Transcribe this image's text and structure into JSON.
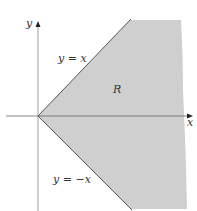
{
  "diagram": {
    "axes": {
      "x_label": "x",
      "y_label": "y"
    },
    "region": {
      "label": "R",
      "fill": "#cfcfcf"
    },
    "lines": [
      {
        "label": "y = x",
        "slope": 1
      },
      {
        "label": "y = −x",
        "slope": -1
      }
    ],
    "colors": {
      "axis": "#777777",
      "boundary": "#555555"
    }
  }
}
